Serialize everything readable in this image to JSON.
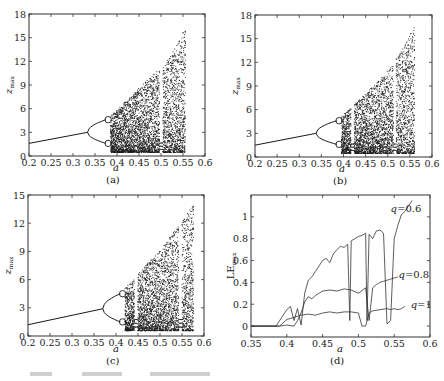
{
  "chart_data": [
    {
      "panel": "(a)",
      "type": "scatter",
      "title": "",
      "xlabel": "a",
      "ylabel": "z_max",
      "xlim": [
        0.2,
        0.6
      ],
      "ylim": [
        0,
        18
      ],
      "xticks": [
        0.2,
        0.25,
        0.3,
        0.35,
        0.4,
        0.45,
        0.5,
        0.55,
        0.6
      ],
      "xtick_labels": [
        "0.2",
        "0.25",
        "0.3",
        "0.35",
        "0.4",
        "0.45",
        "0.5",
        "0.55",
        "0.6"
      ],
      "yticks": [
        0,
        3,
        6,
        9,
        12,
        15,
        18
      ],
      "ytick_labels": [
        "0",
        "3",
        "6",
        "9",
        "12",
        "15",
        "18"
      ],
      "grid": false,
      "description": "Bifurcation diagram of z_max vs a",
      "period1_line": {
        "x": [
          0.2,
          0.333
        ],
        "y": [
          1.6,
          3.0
        ]
      },
      "period2_bifurcation_a": 0.333,
      "period4_bifurcation_a": 0.375,
      "chaos_onset_a": 0.385,
      "upper_envelope": {
        "x": [
          0.385,
          0.43,
          0.47,
          0.51,
          0.53,
          0.555
        ],
        "y": [
          5.2,
          7.6,
          9.8,
          11.8,
          13.8,
          16.5
        ]
      },
      "lower_envelope_y": 0.5,
      "periodic_windows_a": [
        0.5
      ],
      "chaos_end_a": 0.555
    },
    {
      "panel": "(b)",
      "type": "scatter",
      "xlabel": "a",
      "ylabel": "z_max",
      "xlim": [
        0.2,
        0.6
      ],
      "ylim": [
        0,
        18
      ],
      "xticks": [
        0.2,
        0.25,
        0.3,
        0.35,
        0.4,
        0.45,
        0.5,
        0.55,
        0.6
      ],
      "xtick_labels": [
        "0.2",
        "0.25",
        "0.3",
        "0.35",
        "0.4",
        "0.45",
        "0.5",
        "0.55",
        "0.6"
      ],
      "yticks": [
        0,
        3,
        6,
        9,
        12,
        15,
        18
      ],
      "ytick_labels": [
        "0",
        "3",
        "6",
        "9",
        "12",
        "15",
        "18"
      ],
      "grid": false,
      "description": "Bifurcation diagram of z_max vs a",
      "period1_line": {
        "x": [
          0.2,
          0.338
        ],
        "y": [
          1.5,
          3.0
        ]
      },
      "period2_bifurcation_a": 0.338,
      "period4_bifurcation_a": 0.385,
      "chaos_onset_a": 0.395,
      "upper_envelope": {
        "x": [
          0.395,
          0.44,
          0.48,
          0.51,
          0.535,
          0.56
        ],
        "y": [
          5.2,
          7.6,
          9.8,
          11.8,
          14.0,
          16.7
        ]
      },
      "lower_envelope_y": 0.5,
      "periodic_windows_a": [
        0.42,
        0.515
      ],
      "chaos_end_a": 0.56
    },
    {
      "panel": "(c)",
      "type": "scatter",
      "xlabel": "a",
      "ylabel": "z_max",
      "xlim": [
        0.2,
        0.6
      ],
      "ylim": [
        0,
        15
      ],
      "xticks": [
        0.2,
        0.25,
        0.3,
        0.35,
        0.4,
        0.45,
        0.5,
        0.55,
        0.6
      ],
      "xtick_labels": [
        "0.2",
        "0.25",
        "0.3",
        "0.35",
        "0.4",
        "0.45",
        "0.5",
        "0.55",
        "0.6"
      ],
      "yticks": [
        0,
        3,
        6,
        9,
        12,
        15
      ],
      "ytick_labels": [
        "0",
        "3",
        "6",
        "9",
        "12",
        "15"
      ],
      "grid": false,
      "description": "Bifurcation diagram of z_max vs a",
      "period1_line": {
        "x": [
          0.2,
          0.37
        ],
        "y": [
          1.2,
          2.9
        ]
      },
      "period2_bifurcation_a": 0.37,
      "period4_bifurcation_a": 0.41,
      "chaos_onset_a": 0.42,
      "upper_envelope": {
        "x": [
          0.42,
          0.46,
          0.5,
          0.54,
          0.56,
          0.575
        ],
        "y": [
          5.1,
          7.2,
          9.3,
          11.7,
          13.0,
          14.3
        ]
      },
      "lower_envelope_y": 0.6,
      "periodic_windows_a": [
        0.445,
        0.545
      ],
      "chaos_end_a": 0.575
    },
    {
      "panel": "(d)",
      "type": "line",
      "xlabel": "a",
      "ylabel": "LE_max",
      "xlim": [
        0.35,
        0.6
      ],
      "ylim": [
        -0.1,
        1.2
      ],
      "xticks": [
        0.35,
        0.4,
        0.45,
        0.5,
        0.55,
        0.6
      ],
      "xtick_labels": [
        "0.35",
        "0.4",
        "0.45",
        "0.5",
        "0.55",
        "0.6"
      ],
      "yticks": [
        0,
        0.2,
        0.4,
        0.6,
        0.8,
        1
      ],
      "ytick_labels": [
        "0",
        "0.2",
        "0.4",
        "0.6",
        "0.8",
        "1"
      ],
      "grid": false,
      "legend": "inline labels at right end of each curve",
      "series": [
        {
          "name": "q=0.6",
          "x": [
            0.35,
            0.37,
            0.385,
            0.39,
            0.4,
            0.405,
            0.41,
            0.415,
            0.42,
            0.425,
            0.43,
            0.435,
            0.44,
            0.445,
            0.45,
            0.455,
            0.46,
            0.465,
            0.47,
            0.475,
            0.48,
            0.485,
            0.488,
            0.49,
            0.495,
            0.5,
            0.505,
            0.51,
            0.512,
            0.515,
            0.52,
            0.525,
            0.53,
            0.535,
            0.54,
            0.545,
            0.55,
            0.555,
            0.56,
            0.565,
            0.57,
            0.575
          ],
          "y": [
            0,
            0,
            0,
            0.05,
            0.15,
            0.18,
            0.05,
            0.16,
            0.01,
            0.3,
            0.42,
            0.45,
            0.5,
            0.55,
            0.6,
            0.62,
            0.58,
            0.66,
            0.7,
            0.73,
            0.72,
            0.75,
            0.05,
            0.78,
            0.8,
            0.82,
            0.83,
            0.85,
            0.05,
            0.84,
            0.8,
            0.87,
            0.88,
            0.85,
            0.02,
            0.05,
            0.8,
            0.92,
            1.02,
            1.05,
            1.1,
            1.15
          ]
        },
        {
          "name": "q=0.8",
          "x": [
            0.35,
            0.38,
            0.39,
            0.4,
            0.41,
            0.415,
            0.42,
            0.425,
            0.43,
            0.435,
            0.44,
            0.445,
            0.45,
            0.46,
            0.47,
            0.48,
            0.49,
            0.5,
            0.51,
            0.515,
            0.52,
            0.525,
            0.53,
            0.535,
            0.54,
            0.545,
            0.55,
            0.555
          ],
          "y": [
            0,
            0,
            0,
            0.01,
            0.0,
            0.05,
            0.12,
            0.22,
            0.27,
            0.25,
            0.28,
            0.3,
            0.32,
            0.33,
            0.32,
            0.34,
            0.33,
            0.3,
            0.35,
            0.05,
            0.35,
            0.38,
            0.4,
            0.41,
            0.42,
            0.43,
            0.44,
            0.45
          ]
        },
        {
          "name": "q=1",
          "x": [
            0.35,
            0.38,
            0.39,
            0.4,
            0.41,
            0.42,
            0.43,
            0.44,
            0.45,
            0.46,
            0.47,
            0.48,
            0.49,
            0.5,
            0.505,
            0.51,
            0.515,
            0.52,
            0.53,
            0.54,
            0.545,
            0.55,
            0.555,
            0.56,
            0.565
          ],
          "y": [
            0,
            0,
            0,
            0.06,
            0.08,
            0.1,
            0.11,
            0.1,
            0.12,
            0.13,
            0.12,
            0.13,
            0.13,
            0.12,
            0.0,
            0.0,
            0.12,
            0.14,
            0.15,
            0.16,
            0.15,
            0.16,
            0.15,
            0.16,
            0.18
          ]
        }
      ]
    }
  ],
  "panels": {
    "a": {
      "label": "(a)",
      "xlabel": "a",
      "ylabel_main": "z",
      "ylabel_sub": "max"
    },
    "b": {
      "label": "(b)",
      "xlabel": "a",
      "ylabel_main": "z",
      "ylabel_sub": "max"
    },
    "c": {
      "label": "(c)",
      "xlabel": "a",
      "ylabel_main": "z",
      "ylabel_sub": "max"
    },
    "d": {
      "label": "(d)",
      "xlabel": "a",
      "ylabel_main": "LE",
      "ylabel_sub": "max",
      "series_labels": {
        "q06": "q=0.6",
        "q08": "q=0.8",
        "q1": "q=1"
      }
    }
  },
  "layout": {
    "frames": {
      "a": {
        "l": 29,
        "t": 14,
        "r": 205,
        "b": 156
      },
      "b": {
        "l": 255,
        "t": 15,
        "r": 432,
        "b": 157
      },
      "c": {
        "l": 28,
        "t": 195,
        "r": 204,
        "b": 336
      },
      "d": {
        "l": 251,
        "t": 195,
        "r": 430,
        "b": 337
      }
    },
    "colors": {
      "ink": "#111111",
      "frame": "#333333",
      "dots": "#1a1a1a"
    }
  }
}
